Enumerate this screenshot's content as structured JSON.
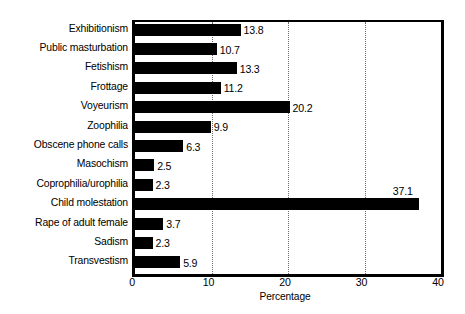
{
  "chart_data": {
    "type": "bar",
    "orientation": "horizontal",
    "title": "",
    "xlabel": "Percentage",
    "ylabel": "",
    "xlim": [
      0,
      40
    ],
    "xticks": [
      "0",
      "10",
      "20",
      "30",
      "40"
    ],
    "gridlines": [
      10,
      20,
      30
    ],
    "grid": true,
    "legend": null,
    "bar_color": "#000000",
    "background_color": "#ffffff",
    "categories": [
      "Exhibitionism",
      "Public masturbation",
      "Fetishism",
      "Frottage",
      "Voyeurism",
      "Zoophilia",
      "Obscene phone calls",
      "Masochism",
      "Coprophilia/urophilia",
      "Child molestation",
      "Rape of adult female",
      "Sadism",
      "Transvestism"
    ],
    "values": [
      13.8,
      10.7,
      13.3,
      11.2,
      20.2,
      9.9,
      6.3,
      2.5,
      2.3,
      37.1,
      3.7,
      2.3,
      5.9
    ],
    "value_labels": [
      "13.8",
      "10.7",
      "13.3",
      "11.2",
      "20.2",
      "9.9",
      "6.3",
      "2.5",
      "2.3",
      "37.1",
      "3.7",
      "2.3",
      "5.9"
    ]
  }
}
